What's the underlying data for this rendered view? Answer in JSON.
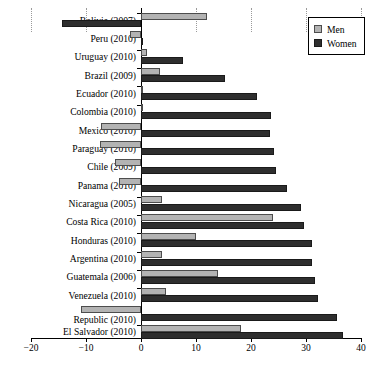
{
  "chart_data": {
    "type": "bar",
    "orientation": "horizontal",
    "title": "",
    "subtitle": "",
    "xlabel": "",
    "ylabel": "",
    "xlim": [
      -20,
      40
    ],
    "xticks": [
      -20,
      -10,
      0,
      10,
      20,
      30,
      40
    ],
    "xticklabels": [
      "-20",
      "-10",
      "0",
      "10",
      "20",
      "30",
      "40"
    ],
    "grid": "vertical-dotted",
    "legend": {
      "position": "top-right",
      "entries": [
        {
          "name": "Men",
          "color": "#b3b3b3"
        },
        {
          "name": "Women",
          "color": "#2e2e2e"
        }
      ]
    },
    "categories": [
      "Bolivia (2007)",
      "Peru (2010)",
      "Uruguay (2010)",
      "Brazil (2009)",
      "Ecuador (2010)",
      "Colombia (2010)",
      "Mexico (2010)",
      "Paraguay (2010)",
      "Chile (2009)",
      "Panama (2010)",
      "Nicaragua (2005)",
      "Costa Rica (2010)",
      "Honduras (2010)",
      "Argentina (2010)",
      "Guatemala (2006)",
      "Venezuela (2010)",
      "Dominican\nRepublic (2010)",
      "El Salvador (2010)"
    ],
    "series": [
      {
        "name": "Men",
        "color": "#b3b3b3",
        "values": [
          12.0,
          -2.0,
          1.0,
          3.5,
          0.3,
          0.4,
          -7.3,
          -7.5,
          -4.8,
          -4.0,
          3.8,
          24.0,
          10.0,
          3.9,
          14.0,
          4.5,
          -11.0,
          18.2
        ]
      },
      {
        "name": "Women",
        "color": "#2e2e2e",
        "values": [
          -14.3,
          0.2,
          7.6,
          15.2,
          21.0,
          23.6,
          23.5,
          24.2,
          24.5,
          26.5,
          29.0,
          29.6,
          31.0,
          31.0,
          31.6,
          32.2,
          35.6,
          36.7
        ]
      }
    ]
  }
}
